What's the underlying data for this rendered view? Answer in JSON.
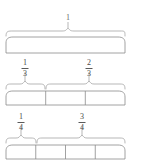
{
  "figure": {
    "stroke_color": "#8a8a8a",
    "text_color": "#4a4a4a",
    "background": "#ffffff"
  },
  "rows": [
    {
      "id": "row-whole",
      "bar_divisions": 1,
      "labels": [
        {
          "text": "1",
          "kind": "whole",
          "span_start": 0,
          "span_end": 1
        }
      ]
    },
    {
      "id": "row-thirds",
      "bar_divisions": 3,
      "labels": [
        {
          "numerator": "1",
          "denominator": "3",
          "kind": "fraction",
          "span_start": 0,
          "span_end": 0.3333
        },
        {
          "numerator": "2",
          "denominator": "3",
          "kind": "fraction",
          "span_start": 0.3333,
          "span_end": 1
        }
      ]
    },
    {
      "id": "row-fourths",
      "bar_divisions": 4,
      "labels": [
        {
          "numerator": "1",
          "denominator": "4",
          "kind": "fraction",
          "span_start": 0,
          "span_end": 0.25
        },
        {
          "numerator": "3",
          "denominator": "4",
          "kind": "fraction",
          "span_start": 0.25,
          "span_end": 1
        }
      ]
    }
  ],
  "text": {
    "whole_label": "1",
    "third_num": "1",
    "third_den": "3",
    "two_thirds_num": "2",
    "two_thirds_den": "3",
    "fourth_num": "1",
    "fourth_den": "4",
    "three_fourths_num": "3",
    "three_fourths_den": "4"
  }
}
